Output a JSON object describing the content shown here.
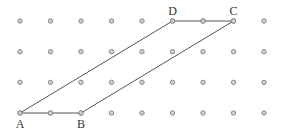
{
  "diagram": {
    "type": "dot-grid-parallelogram",
    "grid": {
      "columns": 9,
      "rows": 4,
      "origin_x": 20,
      "origin_y": 21,
      "spacing_x": 30.5,
      "spacing_y": 30.67,
      "dot_color": "#8a8a8a",
      "dot_fill": "#d0d0d0"
    },
    "line_color": "#555555",
    "points": [
      {
        "label": "A",
        "col": 0,
        "row": 3,
        "label_pos": "below"
      },
      {
        "label": "B",
        "col": 2,
        "row": 3,
        "label_pos": "below"
      },
      {
        "label": "C",
        "col": 7,
        "row": 0,
        "label_pos": "above"
      },
      {
        "label": "D",
        "col": 5,
        "row": 0,
        "label_pos": "above"
      }
    ],
    "polygon": [
      "A",
      "B",
      "C",
      "D"
    ],
    "labels": {
      "A": "A",
      "B": "B",
      "C": "C",
      "D": "D"
    }
  }
}
